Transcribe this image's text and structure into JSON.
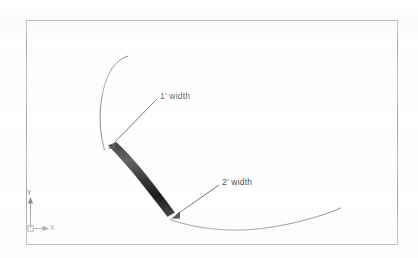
{
  "document": {
    "type": "cad-drawing",
    "title": "Tapered polyline arc width illustration"
  },
  "drawing": {
    "border": {
      "name": "drawing-border",
      "x": 26,
      "y": 20,
      "width": 372,
      "height": 225,
      "stroke_color": "#9a9a9a",
      "stroke_width": 1
    },
    "annotations": [
      {
        "id": "width-1",
        "label": "1' width",
        "text_x": 160,
        "text_y": 91,
        "leader_from_x": 157,
        "leader_from_y": 99,
        "leader_to_x": 108,
        "leader_to_y": 147,
        "arrow": true
      },
      {
        "id": "width-2",
        "label": "2' width",
        "text_x": 222,
        "text_y": 177,
        "leader_from_x": 219,
        "leader_from_y": 185,
        "leader_to_x": 172,
        "leader_to_y": 217,
        "arrow": true
      }
    ],
    "tapered_band": {
      "name": "tapered-polyline-band",
      "fill_color": "#000000",
      "start_width_label": "1' width",
      "end_width_label": "2' width",
      "start_point_x": 105,
      "start_point_y": 148,
      "end_point_x": 169,
      "end_point_y": 218
    },
    "thin_arcs": [
      {
        "id": "upper-arc",
        "stroke_color": "#5f5f5f",
        "from_x": 104,
        "from_y": 150,
        "to_x": 128,
        "to_y": 56
      },
      {
        "id": "lower-arc",
        "stroke_color": "#5f5f5f",
        "from_x": 170,
        "from_y": 219,
        "to_x": 341,
        "to_y": 208
      }
    ],
    "ucs_icon": {
      "name": "ucs-coordinate-icon",
      "origin_x": 30,
      "origin_y": 228,
      "y_axis_label": "Y",
      "x_axis_label": "X",
      "stroke_color": "#7d7d7d"
    }
  },
  "colors": {
    "page_background": "#ffffff",
    "border_stroke": "#9a9a9a",
    "arc_stroke": "#5f5f5f",
    "band_fill": "#000000",
    "label_text": "#1a1a1a",
    "axis_text": "#6a6a6a"
  }
}
